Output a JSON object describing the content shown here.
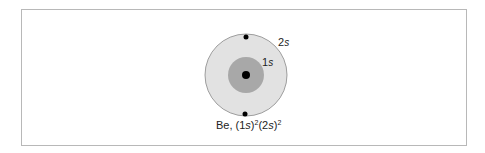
{
  "diagram": {
    "element": "Be",
    "configuration_text": "Be, (1s)²(2s)²",
    "shells": [
      {
        "label": "2s",
        "electrons": 2,
        "color": "#e2e2e2"
      },
      {
        "label": "1s",
        "electrons": 2,
        "color": "#a8a8a8"
      }
    ],
    "nucleus_color": "#000000",
    "labels": {
      "outer": "2",
      "outer_italic": "s",
      "inner": "1",
      "inner_italic": "s",
      "caption_prefix": "Be, (1",
      "caption_s1": "s",
      "caption_mid": ")",
      "caption_sup1": "2",
      "caption_open2": "(2",
      "caption_s2": "s",
      "caption_close2": ")",
      "caption_sup2": "2"
    }
  }
}
